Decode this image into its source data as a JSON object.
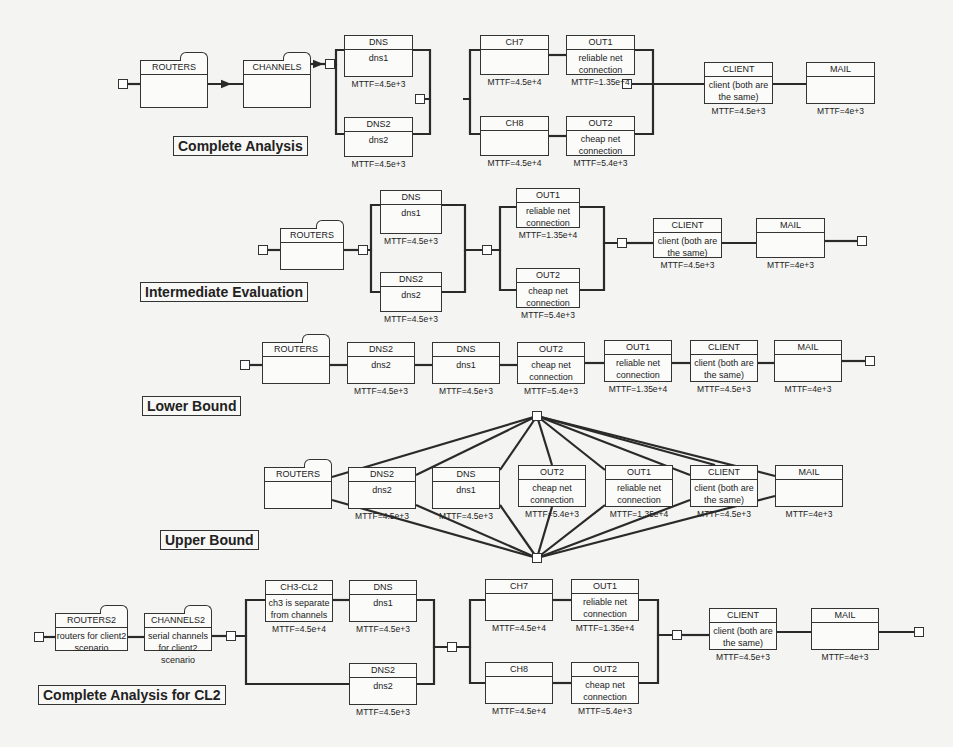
{
  "diagram": {
    "sections": [
      {
        "id": "complete",
        "label": "Complete Analysis",
        "label_pos": [
          173,
          136
        ],
        "terminals": [
          [
            118,
            79
          ],
          [
            325,
            59
          ],
          [
            415,
            94
          ],
          [
            622,
            79
          ],
          [
            854,
            79
          ]
        ],
        "blocks": [
          {
            "id": "routers",
            "name": "ROUTERS",
            "desc": "",
            "mttf": "",
            "x": 140,
            "y": 60,
            "w": 68,
            "h": 48,
            "folder": true
          },
          {
            "id": "channels",
            "name": "CHANNELS",
            "desc": "",
            "mttf": "",
            "x": 243,
            "y": 60,
            "w": 68,
            "h": 48,
            "folder": true
          },
          {
            "id": "dns",
            "name": "DNS",
            "desc": "dns1",
            "mttf": "MTTF=4.5e+3",
            "x": 344,
            "y": 35,
            "w": 69,
            "h": 42
          },
          {
            "id": "dns2",
            "name": "DNS2",
            "desc": "dns2",
            "mttf": "MTTF=4.5e+3",
            "x": 344,
            "y": 117,
            "w": 69,
            "h": 40
          },
          {
            "id": "ch7",
            "name": "CH7",
            "desc": "",
            "mttf": "MTTF=4.5e+4",
            "x": 480,
            "y": 35,
            "w": 69,
            "h": 40
          },
          {
            "id": "out1",
            "name": "OUT1",
            "desc": "reliable net connection",
            "mttf": "MTTF=1.35e+4",
            "x": 566,
            "y": 35,
            "w": 69,
            "h": 40
          },
          {
            "id": "ch8",
            "name": "CH8",
            "desc": "",
            "mttf": "MTTF=4.5e+4",
            "x": 480,
            "y": 116,
            "w": 69,
            "h": 40
          },
          {
            "id": "out2",
            "name": "OUT2",
            "desc": "cheap net connection",
            "mttf": "MTTF=5.4e+3",
            "x": 566,
            "y": 116,
            "w": 69,
            "h": 40
          },
          {
            "id": "client",
            "name": "CLIENT",
            "desc": "client (both are the same)",
            "mttf": "MTTF=4.5e+3",
            "x": 704,
            "y": 62,
            "w": 69,
            "h": 42
          },
          {
            "id": "mail",
            "name": "MAIL",
            "desc": "",
            "mttf": "MTTF=4e+3",
            "x": 806,
            "y": 62,
            "w": 69,
            "h": 42
          }
        ]
      },
      {
        "id": "intermediate",
        "label": "Intermediate Evaluation",
        "label_pos": [
          140,
          282
        ],
        "terminals": [
          [
            258,
            245
          ],
          [
            358,
            245
          ],
          [
            482,
            245
          ],
          [
            617,
            238
          ],
          [
            857,
            236
          ]
        ],
        "blocks": [
          {
            "id": "routers",
            "name": "ROUTERS",
            "desc": "",
            "mttf": "",
            "x": 280,
            "y": 228,
            "w": 64,
            "h": 42,
            "folder": true
          },
          {
            "id": "dns",
            "name": "DNS",
            "desc": "dns1",
            "mttf": "MTTF=4.5e+3",
            "x": 380,
            "y": 190,
            "w": 62,
            "h": 44
          },
          {
            "id": "dns2",
            "name": "DNS2",
            "desc": "dns2",
            "mttf": "MTTF=4.5e+3",
            "x": 380,
            "y": 272,
            "w": 62,
            "h": 40
          },
          {
            "id": "out1",
            "name": "OUT1",
            "desc": "reliable net connection",
            "mttf": "MTTF=1.35e+4",
            "x": 516,
            "y": 188,
            "w": 64,
            "h": 40
          },
          {
            "id": "out2",
            "name": "OUT2",
            "desc": "cheap net connection",
            "mttf": "MTTF=5.4e+3",
            "x": 516,
            "y": 268,
            "w": 64,
            "h": 40
          },
          {
            "id": "client",
            "name": "CLIENT",
            "desc": "client (both are the same)",
            "mttf": "MTTF=4.5e+3",
            "x": 653,
            "y": 218,
            "w": 69,
            "h": 40
          },
          {
            "id": "mail",
            "name": "MAIL",
            "desc": "",
            "mttf": "MTTF=4e+3",
            "x": 756,
            "y": 218,
            "w": 69,
            "h": 40
          }
        ]
      },
      {
        "id": "lower",
        "label": "Lower Bound",
        "label_pos": [
          142,
          396
        ],
        "terminals": [
          [
            240,
            360
          ],
          [
            865,
            356
          ]
        ],
        "blocks": [
          {
            "id": "routers",
            "name": "ROUTERS",
            "desc": "",
            "mttf": "",
            "x": 262,
            "y": 342,
            "w": 68,
            "h": 42,
            "folder": true
          },
          {
            "id": "dns2",
            "name": "DNS2",
            "desc": "dns2",
            "mttf": "MTTF=4.5e+3",
            "x": 347,
            "y": 342,
            "w": 68,
            "h": 42
          },
          {
            "id": "dns",
            "name": "DNS",
            "desc": "dns1",
            "mttf": "MTTF=4.5e+3",
            "x": 432,
            "y": 342,
            "w": 68,
            "h": 42
          },
          {
            "id": "out2",
            "name": "OUT2",
            "desc": "cheap net connection",
            "mttf": "MTTF=5.4e+3",
            "x": 517,
            "y": 342,
            "w": 68,
            "h": 42
          },
          {
            "id": "out1",
            "name": "OUT1",
            "desc": "reliable net connection",
            "mttf": "MTTF=1.35e+4",
            "x": 604,
            "y": 340,
            "w": 68,
            "h": 42
          },
          {
            "id": "client",
            "name": "CLIENT",
            "desc": "client (both are the same)",
            "mttf": "MTTF=4.5e+3",
            "x": 690,
            "y": 340,
            "w": 68,
            "h": 42
          },
          {
            "id": "mail",
            "name": "MAIL",
            "desc": "",
            "mttf": "MTTF=4e+3",
            "x": 774,
            "y": 340,
            "w": 68,
            "h": 42
          }
        ]
      },
      {
        "id": "upper",
        "label": "Upper Bound",
        "label_pos": [
          160,
          530
        ],
        "terminals": [
          [
            532,
            411
          ],
          [
            532,
            553
          ]
        ],
        "blocks": [
          {
            "id": "routers",
            "name": "ROUTERS",
            "desc": "",
            "mttf": "",
            "x": 264,
            "y": 467,
            "w": 68,
            "h": 42,
            "folder": true
          },
          {
            "id": "dns2",
            "name": "DNS2",
            "desc": "dns2",
            "mttf": "MTTF=4.5e+3",
            "x": 348,
            "y": 467,
            "w": 68,
            "h": 42
          },
          {
            "id": "dns",
            "name": "DNS",
            "desc": "dns1",
            "mttf": "MTTF=4.5e+3",
            "x": 432,
            "y": 467,
            "w": 68,
            "h": 42
          },
          {
            "id": "out2",
            "name": "OUT2",
            "desc": "cheap net connection",
            "mttf": "MTTF=5.4e+3",
            "x": 518,
            "y": 465,
            "w": 68,
            "h": 42
          },
          {
            "id": "out1",
            "name": "OUT1",
            "desc": "reliable net connection",
            "mttf": "MTTF=1.35e+4",
            "x": 605,
            "y": 465,
            "w": 68,
            "h": 42
          },
          {
            "id": "client",
            "name": "CLIENT",
            "desc": "client (both are the same)",
            "mttf": "MTTF=4.5e+3",
            "x": 690,
            "y": 465,
            "w": 68,
            "h": 42
          },
          {
            "id": "mail",
            "name": "MAIL",
            "desc": "",
            "mttf": "MTTF=4e+3",
            "x": 775,
            "y": 465,
            "w": 68,
            "h": 42
          }
        ]
      },
      {
        "id": "complete_cl2",
        "label": "Complete Analysis for CL2",
        "label_pos": [
          38,
          685
        ],
        "terminals": [
          [
            34,
            632
          ],
          [
            226,
            631
          ],
          [
            447,
            642
          ],
          [
            672,
            630
          ],
          [
            914,
            627
          ]
        ],
        "blocks": [
          {
            "id": "routers2",
            "name": "ROUTERS2",
            "desc": "routers for client2 scenario",
            "mttf": "",
            "x": 55,
            "y": 613,
            "w": 73,
            "h": 38,
            "folder": true
          },
          {
            "id": "channels2",
            "name": "CHANNELS2",
            "desc": "serial channels for client2 scenario",
            "mttf": "",
            "x": 144,
            "y": 613,
            "w": 68,
            "h": 38,
            "folder": true
          },
          {
            "id": "ch3cl2",
            "name": "CH3-CL2",
            "desc": "ch3 is separate from channels",
            "mttf": "MTTF=4.5e+4",
            "x": 265,
            "y": 580,
            "w": 68,
            "h": 42
          },
          {
            "id": "dns",
            "name": "DNS",
            "desc": "dns1",
            "mttf": "MTTF=4.5e+3",
            "x": 349,
            "y": 580,
            "w": 68,
            "h": 42
          },
          {
            "id": "dns2",
            "name": "DNS2",
            "desc": "dns2",
            "mttf": "MTTF=4.5e+3",
            "x": 349,
            "y": 663,
            "w": 68,
            "h": 42
          },
          {
            "id": "ch7",
            "name": "CH7",
            "desc": "",
            "mttf": "MTTF=4.5e+4",
            "x": 485,
            "y": 579,
            "w": 68,
            "h": 42
          },
          {
            "id": "out1",
            "name": "OUT1",
            "desc": "reliable net connection",
            "mttf": "MTTF=1.35e+4",
            "x": 571,
            "y": 579,
            "w": 68,
            "h": 42
          },
          {
            "id": "ch8",
            "name": "CH8",
            "desc": "",
            "mttf": "MTTF=4.5e+4",
            "x": 485,
            "y": 662,
            "w": 68,
            "h": 42
          },
          {
            "id": "out2",
            "name": "OUT2",
            "desc": "cheap net connection",
            "mttf": "MTTF=5.4e+3",
            "x": 571,
            "y": 662,
            "w": 68,
            "h": 42
          },
          {
            "id": "client",
            "name": "CLIENT",
            "desc": "client (both are the same)",
            "mttf": "MTTF=4.5e+3",
            "x": 709,
            "y": 608,
            "w": 68,
            "h": 42
          },
          {
            "id": "mail",
            "name": "MAIL",
            "desc": "",
            "mttf": "MTTF=4e+3",
            "x": 811,
            "y": 608,
            "w": 68,
            "h": 42
          }
        ]
      }
    ],
    "colors": {
      "line": "#2a2a2a",
      "box_border": "#333333",
      "background": "#f4f4f2"
    }
  }
}
